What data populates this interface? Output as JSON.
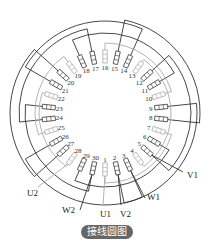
{
  "diagram": {
    "title": "接线圆图",
    "center": [
      105,
      113
    ],
    "slot_count": 30,
    "slot_label_radius": 46,
    "slot_inner_radius": 50,
    "slot_outer_radius": 63,
    "start_angle_deg": 90,
    "direction": "counterclockwise",
    "colors": {
      "dark": "#333333",
      "light": "#aaaaaa"
    },
    "slots": [
      {
        "n": "1",
        "phase": "light"
      },
      {
        "n": "2",
        "phase": "dark"
      },
      {
        "n": "3",
        "phase": "dark"
      },
      {
        "n": "4",
        "phase": "light"
      },
      {
        "n": "5",
        "phase": "dark"
      },
      {
        "n": "6",
        "phase": "dark"
      },
      {
        "n": "7",
        "phase": "light"
      },
      {
        "n": "8",
        "phase": "dark"
      },
      {
        "n": "9",
        "phase": "dark"
      },
      {
        "n": "10",
        "phase": "light"
      },
      {
        "n": "11",
        "phase": "dark"
      },
      {
        "n": "12",
        "phase": "dark"
      },
      {
        "n": "13",
        "phase": "light"
      },
      {
        "n": "14",
        "phase": "dark"
      },
      {
        "n": "15",
        "phase": "dark"
      },
      {
        "n": "16",
        "phase": "light"
      },
      {
        "n": "17",
        "phase": "dark"
      },
      {
        "n": "18",
        "phase": "dark"
      },
      {
        "n": "19",
        "phase": "light"
      },
      {
        "n": "20",
        "phase": "dark"
      },
      {
        "n": "21",
        "phase": "dark"
      },
      {
        "n": "22",
        "phase": "light"
      },
      {
        "n": "23",
        "phase": "dark"
      },
      {
        "n": "24",
        "phase": "dark"
      },
      {
        "n": "25",
        "phase": "light"
      },
      {
        "n": "26",
        "phase": "dark"
      },
      {
        "n": "27",
        "phase": "dark"
      },
      {
        "n": "28",
        "phase": "light"
      },
      {
        "n": "29",
        "phase": "dark"
      },
      {
        "n": "30",
        "phase": "dark"
      }
    ],
    "coils": [
      {
        "a": 2,
        "b": 9,
        "r": 92,
        "phase": "dark"
      },
      {
        "a": 5,
        "b": 12,
        "r": 86,
        "phase": "dark"
      },
      {
        "a": 8,
        "b": 15,
        "r": 95,
        "phase": "dark"
      },
      {
        "a": 11,
        "b": 18,
        "r": 80,
        "phase": "dark"
      },
      {
        "a": 14,
        "b": 21,
        "r": 92,
        "phase": "dark"
      },
      {
        "a": 17,
        "b": 24,
        "r": 86,
        "phase": "dark"
      },
      {
        "a": 20,
        "b": 27,
        "r": 95,
        "phase": "dark"
      },
      {
        "a": 23,
        "b": 30,
        "r": 80,
        "phase": "dark"
      },
      {
        "a": 26,
        "b": 3,
        "r": 92,
        "phase": "dark"
      },
      {
        "a": 29,
        "b": 6,
        "r": 74,
        "phase": "dark"
      },
      {
        "a": 1,
        "b": 7,
        "r": 70,
        "phase": "light"
      },
      {
        "a": 10,
        "b": 16,
        "r": 70,
        "phase": "light"
      },
      {
        "a": 19,
        "b": 25,
        "r": 70,
        "phase": "light"
      },
      {
        "a": 4,
        "b": 13,
        "r": 66,
        "phase": "light"
      },
      {
        "a": 22,
        "b": 28,
        "r": 66,
        "phase": "light"
      }
    ],
    "leads": [
      {
        "label": "U1",
        "slot": 1,
        "end": [
          103,
          205
        ],
        "text": [
          100,
          217
        ],
        "phase": "light"
      },
      {
        "label": "V2",
        "slot": 2,
        "end": [
          121,
          205
        ],
        "text": [
          120,
          217
        ],
        "phase": "dark"
      },
      {
        "label": "W1",
        "slot": 3,
        "end": [
          145,
          198
        ],
        "text": [
          147,
          200
        ],
        "phase": "dark"
      },
      {
        "label": "V1",
        "slot": 5,
        "end": [
          183,
          172
        ],
        "text": [
          187,
          178
        ],
        "phase": "dark"
      },
      {
        "label": "W2",
        "slot": 30,
        "end": [
          80,
          210
        ],
        "text": [
          62,
          213
        ],
        "phase": "dark"
      },
      {
        "label": "U2",
        "slot": 28,
        "end": [
          38,
          187
        ],
        "text": [
          27,
          196
        ],
        "phase": "light"
      }
    ]
  }
}
